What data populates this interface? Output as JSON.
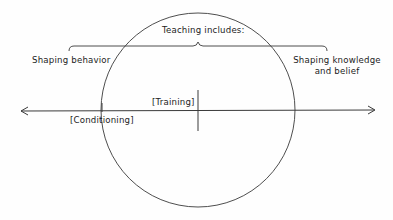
{
  "diagram": {
    "title": "Teaching includes:",
    "left_label": "Shaping behavior",
    "right_label_line1": "Shaping knowledge",
    "right_label_line2": "and belief",
    "axis_points": [
      {
        "label": "[Training]"
      },
      {
        "label": "[Conditioning]"
      }
    ],
    "colors": {
      "stroke": "#3a3a3a",
      "text": "#1c1c1c",
      "background": "#fefefe"
    }
  }
}
